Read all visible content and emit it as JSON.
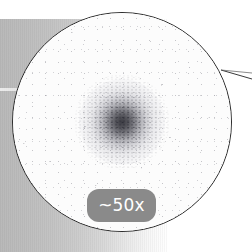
{
  "view": {
    "kind": "magnifier-scope-view",
    "background_color": "#ffffff"
  },
  "left_panel": {
    "name": "gradient-panel",
    "from_color": "#b9b9b9",
    "to_color": "#ffffff"
  },
  "scope": {
    "name": "magnifier-circle",
    "outline_color": "#2b2b2b",
    "field_color": "#fdfdfd",
    "specimen": {
      "label": "specimen-blob",
      "color": "#2e2e38"
    }
  },
  "callout": {
    "name": "leader-line",
    "color": "#3a3a3a"
  },
  "zoom_badge": {
    "label": "~50x",
    "background_color": "#8a8a8a",
    "text_color": "#ffffff"
  }
}
